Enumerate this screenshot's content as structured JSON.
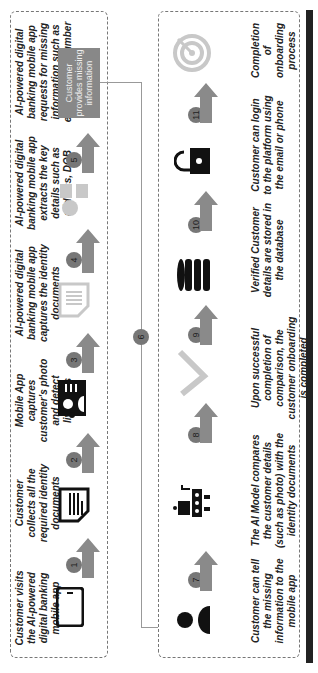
{
  "top_row": {
    "steps": [
      {
        "num": "1",
        "text": "Customer visits the AI-powered digital banking mobile app",
        "icon": "smartphone-icon"
      },
      {
        "num": "2",
        "text": "Customer collects all the required identity documents",
        "icon": "document-icon"
      },
      {
        "num": "3",
        "text": "Mobile App captures customer's photo and detect liveliness",
        "icon": "id-card-icon"
      },
      {
        "num": "4",
        "text": "AI-powered digital banking mobile app captures the identity documents",
        "icon": "document-scan-icon"
      },
      {
        "num": "5",
        "text": "AI-powered digital banking mobile app extracts the key details such as address, DOB",
        "icon": "person-details-icon"
      },
      {
        "text": "AI-powered digital banking mobile app requests for missing information such as email, phone number"
      }
    ],
    "missing_info_box": "Customer provides missing information"
  },
  "connector_badge": "6",
  "bottom_row": {
    "steps": [
      {
        "num": "7",
        "text": "Customer can tell the missing information to the mobile app",
        "icon": "person-icon"
      },
      {
        "num": "8",
        "text": "The AI Model compares the customer details (such as photo) with the identity documents",
        "icon": "robot-icon"
      },
      {
        "num": "9",
        "text": "Upon successful completion of comparison, the customer onboarding is completed",
        "icon": "checkmark-icon"
      },
      {
        "num": "10",
        "text": "Verified Customer details are stored in the database",
        "icon": "database-icon"
      },
      {
        "num": "11",
        "text": "Customer can login to the platform using the email or phone",
        "icon": "lock-icon"
      },
      {
        "text": "Completion of onboarding process",
        "icon": "target-icon"
      }
    ]
  },
  "colors": {
    "arrow": "#8a8a8a",
    "badge": "#7a7a7a",
    "icon_dark": "#111111",
    "icon_light": "#c8c8c8",
    "bar": "#222222"
  }
}
